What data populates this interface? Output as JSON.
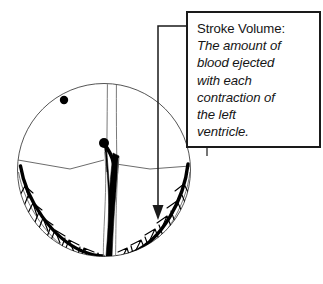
{
  "figure": {
    "callout": {
      "heading": "Stroke Volume:",
      "lines": [
        "The amount of",
        "blood ejected",
        "with each",
        "contraction of",
        "the left",
        "ventricle."
      ],
      "border_color": "#1a1a1a",
      "background_color": "#ffffff",
      "text_color": "#151515"
    },
    "leader": {
      "label": "arrow pointing from callout box into the left ventricle cavity",
      "color": "#1a1a1a"
    },
    "anatomy": {
      "outline_color": "#4d4d4d",
      "muscle_color": "#000000",
      "markers": [
        {
          "name": "upper-marker-dot",
          "cx": 64,
          "cy": 100,
          "r": 4.2,
          "color": "#000000"
        },
        {
          "name": "septum-marker-dot",
          "cx": 104,
          "cy": 143,
          "r": 5.0,
          "color": "#000000"
        }
      ],
      "circle": {
        "cx": 104,
        "cy": 170,
        "r": 87
      }
    }
  }
}
